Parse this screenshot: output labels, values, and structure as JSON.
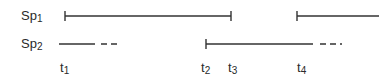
{
  "rows": [
    {
      "label_main": "Sp",
      "label_sub": "1"
    },
    {
      "label_main": "Sp",
      "label_sub": "2"
    }
  ],
  "time_labels": [
    {
      "main": "t",
      "sub": "1",
      "x": 62
    },
    {
      "main": "t",
      "sub": "2",
      "x": 202
    },
    {
      "main": "t",
      "sub": "3",
      "x": 229
    },
    {
      "main": "t",
      "sub": "4",
      "x": 298
    }
  ],
  "colors": {
    "line": "#333333",
    "text": "#2a2a2a"
  }
}
